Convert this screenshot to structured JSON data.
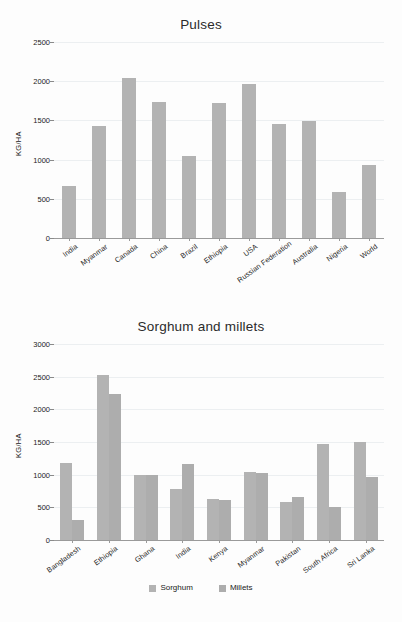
{
  "charts": [
    {
      "id": "pulses",
      "title": "Pulses",
      "ylabel": "KG/HA",
      "type": "bar",
      "ylim": [
        0,
        2500
      ],
      "yticks": [
        0,
        500,
        1000,
        1500,
        2000,
        2500
      ],
      "grid": true,
      "legend": null,
      "categories": [
        "India",
        "Myanmar",
        "Canada",
        "China",
        "Brazil",
        "Ethiopia",
        "USA",
        "Russian Federation",
        "Australia",
        "Nigeria",
        "World"
      ],
      "values": [
        660,
        1430,
        2040,
        1735,
        1040,
        1720,
        1965,
        1460,
        1490,
        585,
        930
      ],
      "chart_data": {
        "type": "bar",
        "title": "Pulses",
        "xlabel": "",
        "ylabel": "KG/HA",
        "ylim": [
          0,
          2500
        ],
        "yticks": [
          0,
          500,
          1000,
          1500,
          2000,
          2500
        ],
        "grid": true,
        "categories": [
          "India",
          "Myanmar",
          "Canada",
          "China",
          "Brazil",
          "Ethiopia",
          "USA",
          "Russian Federation",
          "Australia",
          "Nigeria",
          "World"
        ],
        "values": [
          660,
          1430,
          2040,
          1735,
          1040,
          1720,
          1965,
          1460,
          1490,
          585,
          930
        ]
      }
    },
    {
      "id": "sorghum",
      "title": "Sorghum and millets",
      "ylabel": "KG/HA",
      "type": "bar",
      "ylim": [
        0,
        3000
      ],
      "yticks": [
        0,
        500,
        1000,
        1500,
        2000,
        2500,
        3000
      ],
      "grid": true,
      "categories": [
        "Bangladesh",
        "Ethiopia",
        "Ghana",
        "India",
        "Kenya",
        "Myanmar",
        "Pakistan",
        "South Africa",
        "Sri Lanka"
      ],
      "series": [
        {
          "name": "Sorghum",
          "color": "#b3b3b3",
          "values": [
            1180,
            2520,
            1000,
            780,
            625,
            1040,
            580,
            1470,
            1500
          ]
        },
        {
          "name": "Millets",
          "color": "#adadad",
          "values": [
            300,
            2230,
            990,
            1170,
            610,
            1030,
            660,
            510,
            970
          ]
        }
      ],
      "chart_data": {
        "type": "bar",
        "title": "Sorghum and millets",
        "xlabel": "",
        "ylabel": "KG/HA",
        "ylim": [
          0,
          3000
        ],
        "yticks": [
          0,
          500,
          1000,
          1500,
          2000,
          2500,
          3000
        ],
        "grid": true,
        "legend_position": "bottom",
        "categories": [
          "Bangladesh",
          "Ethiopia",
          "Ghana",
          "India",
          "Kenya",
          "Myanmar",
          "Pakistan",
          "South Africa",
          "Sri Lanka"
        ],
        "series": [
          {
            "name": "Sorghum",
            "values": [
              1180,
              2520,
              1000,
              780,
              625,
              1040,
              580,
              1470,
              1500
            ]
          },
          {
            "name": "Millets",
            "values": [
              300,
              2230,
              990,
              1170,
              610,
              1030,
              660,
              510,
              970
            ]
          }
        ]
      }
    }
  ],
  "chart_data": [
    {
      "type": "bar",
      "title": "Pulses",
      "xlabel": "",
      "ylabel": "KG/HA",
      "ylim": [
        0,
        2500
      ],
      "yticks": [
        0,
        500,
        1000,
        1500,
        2000,
        2500
      ],
      "grid": true,
      "legend": [],
      "categories": [
        "India",
        "Myanmar",
        "Canada",
        "China",
        "Brazil",
        "Ethiopia",
        "USA",
        "Russian Federation",
        "Australia",
        "Nigeria",
        "World"
      ],
      "values": [
        660,
        1430,
        2040,
        1735,
        1040,
        1720,
        1965,
        1460,
        1490,
        585,
        930
      ]
    },
    {
      "type": "bar",
      "title": "Sorghum and millets",
      "xlabel": "",
      "ylabel": "KG/HA",
      "ylim": [
        0,
        3000
      ],
      "yticks": [
        0,
        500,
        1000,
        1500,
        2000,
        2500,
        3000
      ],
      "grid": true,
      "legend": [
        "Sorghum",
        "Millets"
      ],
      "legend_position": "bottom",
      "categories": [
        "Bangladesh",
        "Ethiopia",
        "Ghana",
        "India",
        "Kenya",
        "Myanmar",
        "Pakistan",
        "South Africa",
        "Sri Lanka"
      ],
      "series": [
        {
          "name": "Sorghum",
          "values": [
            1180,
            2520,
            1000,
            780,
            625,
            1040,
            580,
            1470,
            1500
          ]
        },
        {
          "name": "Millets",
          "values": [
            300,
            2230,
            990,
            1170,
            610,
            1030,
            660,
            510,
            970
          ]
        }
      ]
    }
  ],
  "colors": {
    "series1": "#b3b3b3",
    "series2": "#adadad",
    "grid": "#eceff1",
    "axis": "#9a9a9a",
    "text": "#1f1f1f",
    "background": "#fdfdfd"
  }
}
